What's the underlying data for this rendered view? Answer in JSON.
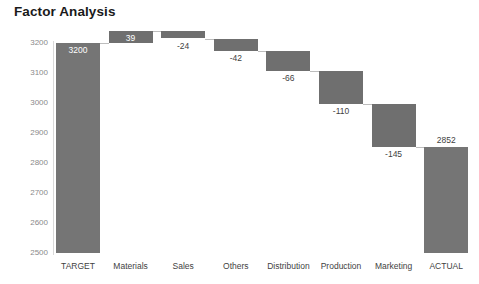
{
  "chart_data": {
    "type": "bar",
    "subtype": "waterfall",
    "title": "Factor Analysis",
    "xlabel": "",
    "ylabel": "",
    "ylim": [
      2500,
      3200
    ],
    "ytick_labels": [
      "3200",
      "3100",
      "3000",
      "2900",
      "2800",
      "2700",
      "2600",
      "2500"
    ],
    "yticks": [
      3200,
      3100,
      3000,
      2900,
      2800,
      2700,
      2600,
      2500
    ],
    "grid": false,
    "legend": null,
    "categories": [
      "TARGET",
      "Materials",
      "Sales",
      "Others",
      "Distribution",
      "Production",
      "Marketing",
      "ACTUAL"
    ],
    "values": [
      3200,
      39,
      -24,
      -42,
      -66,
      -110,
      -145,
      2852
    ],
    "data_labels": [
      "3200",
      "39",
      "-24",
      "-42",
      "-66",
      "-110",
      "-145",
      "2852"
    ],
    "cumulative": [
      3200,
      3239,
      3215,
      3173,
      3107,
      2997,
      2852,
      2852
    ],
    "bar_kinds": [
      "total",
      "delta",
      "delta",
      "delta",
      "delta",
      "delta",
      "delta",
      "total"
    ],
    "bar_color": "#6f6f6f",
    "total_bar_color": "#757575",
    "connector_color": "#bdbdbd",
    "axis_color": "#d9d9d9",
    "label_inside_color": "#ffffff",
    "label_outside_color": "#3f3f3f",
    "tick_label_color": "#8a8a8a",
    "category_label_color": "#3f3f3f",
    "title_color": "#1a1a1a",
    "background_color": "#ffffff",
    "series": [
      {
        "name": "Factor Analysis",
        "points": [
          {
            "category": "TARGET",
            "value": 3200,
            "label": "3200",
            "kind": "total",
            "start": 2500,
            "end": 3200,
            "label_position": "inside"
          },
          {
            "category": "Materials",
            "value": 39,
            "label": "39",
            "kind": "delta",
            "start": 3200,
            "end": 3239,
            "label_position": "inside"
          },
          {
            "category": "Sales",
            "value": -24,
            "label": "-24",
            "kind": "delta",
            "start": 3239,
            "end": 3215,
            "label_position": "below"
          },
          {
            "category": "Others",
            "value": -42,
            "label": "-42",
            "kind": "delta",
            "start": 3215,
            "end": 3173,
            "label_position": "below"
          },
          {
            "category": "Distribution",
            "value": -66,
            "label": "-66",
            "kind": "delta",
            "start": 3173,
            "end": 3107,
            "label_position": "below"
          },
          {
            "category": "Production",
            "value": -110,
            "label": "-110",
            "kind": "delta",
            "start": 3107,
            "end": 2997,
            "label_position": "below"
          },
          {
            "category": "Marketing",
            "value": -145,
            "label": "-145",
            "kind": "delta",
            "start": 2997,
            "end": 2852,
            "label_position": "below"
          },
          {
            "category": "ACTUAL",
            "value": 2852,
            "label": "2852",
            "kind": "total",
            "start": 2500,
            "end": 2852,
            "label_position": "above"
          }
        ]
      }
    ]
  }
}
